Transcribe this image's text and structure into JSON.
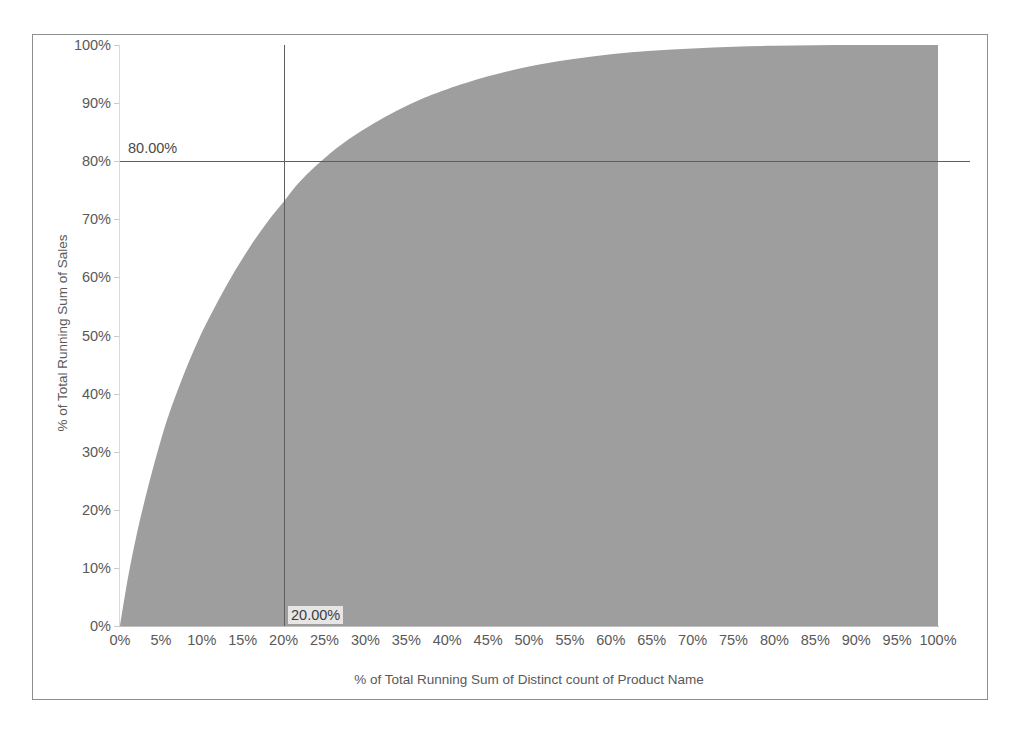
{
  "chart_data": {
    "type": "area",
    "title": "",
    "subtitle": "",
    "xlabel": "% of Total Running Sum of Distinct count of Product Name",
    "ylabel": "% of Total Running Sum of Sales",
    "xlim": [
      0,
      100
    ],
    "ylim": [
      0,
      100
    ],
    "grid": false,
    "legend": "none",
    "fill_color": "#9e9e9e",
    "reference_line_color": "#5d5d5d",
    "x_tick_labels": [
      "0%",
      "5%",
      "10%",
      "15%",
      "20%",
      "25%",
      "30%",
      "35%",
      "40%",
      "45%",
      "50%",
      "55%",
      "60%",
      "65%",
      "70%",
      "75%",
      "80%",
      "85%",
      "90%",
      "95%",
      "100%"
    ],
    "x_tick_values": [
      0,
      5,
      10,
      15,
      20,
      25,
      30,
      35,
      40,
      45,
      50,
      55,
      60,
      65,
      70,
      75,
      80,
      85,
      90,
      95,
      100
    ],
    "y_tick_labels": [
      "0%",
      "10%",
      "20%",
      "30%",
      "40%",
      "50%",
      "60%",
      "70%",
      "80%",
      "90%",
      "100%"
    ],
    "y_tick_values": [
      0,
      10,
      20,
      30,
      40,
      50,
      60,
      70,
      80,
      90,
      100
    ],
    "series": [
      {
        "name": "% of Total Running Sum of Sales",
        "x": [
          0,
          1,
          2,
          3,
          4,
          5,
          6,
          8,
          10,
          12,
          14,
          16,
          18,
          20,
          22,
          25,
          28,
          31,
          34,
          37,
          40,
          45,
          50,
          55,
          60,
          65,
          70,
          75,
          80,
          85,
          90,
          95,
          100
        ],
        "values": [
          0,
          8.5,
          15.5,
          21.5,
          27.0,
          32.0,
          36.5,
          44.0,
          50.5,
          56.0,
          61.0,
          65.5,
          69.5,
          73.0,
          76.5,
          80.5,
          83.8,
          86.5,
          88.8,
          90.8,
          92.4,
          94.6,
          96.3,
          97.5,
          98.4,
          99.0,
          99.4,
          99.7,
          99.85,
          99.95,
          100,
          100,
          100
        ]
      }
    ],
    "reference_lines": [
      {
        "name": "horizontal-80-percent",
        "orientation": "horizontal",
        "value": 80,
        "label": "80.00%"
      },
      {
        "name": "vertical-20-percent",
        "orientation": "vertical",
        "value": 20,
        "label": "20.00%"
      }
    ]
  },
  "axis": {
    "x_title": "% of Total Running Sum of Distinct count of Product Name",
    "y_title": "% of Total Running Sum of Sales"
  },
  "reference_labels": {
    "horizontal": "80.00%",
    "vertical": "20.00%"
  }
}
